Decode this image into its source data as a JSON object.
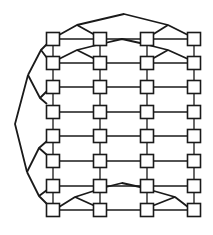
{
  "diagram": {
    "type": "grid-graph-with-tree-connectors",
    "stroke_color": "#1a1a1a",
    "node_fill": "#ffffff",
    "node_size": 13,
    "columns_x": [
      53,
      100,
      147,
      194
    ],
    "rows_y": [
      39,
      63,
      87,
      112,
      136,
      161,
      186,
      210
    ],
    "grid": {
      "rows": 8,
      "cols": 4
    },
    "extra_edges": [
      {
        "name": "top-arc-1",
        "points": [
          [
            59,
            35
          ],
          [
            77,
            25
          ],
          [
            124,
            14
          ],
          [
            168,
            25
          ],
          [
            188,
            35
          ]
        ]
      },
      {
        "name": "top-arc-1-branch-left",
        "points": [
          [
            77,
            25
          ],
          [
            95,
            35
          ]
        ]
      },
      {
        "name": "top-arc-1-branch-right",
        "points": [
          [
            168,
            25
          ],
          [
            152,
            35
          ]
        ]
      },
      {
        "name": "top-arc-2",
        "points": [
          [
            59,
            59
          ],
          [
            77,
            50
          ],
          [
            105,
            43
          ],
          [
            122,
            39
          ],
          [
            140,
            43
          ],
          [
            168,
            50
          ],
          [
            188,
            59
          ]
        ]
      },
      {
        "name": "top-arc-2-branch-left",
        "points": [
          [
            77,
            50
          ],
          [
            95,
            59
          ]
        ]
      },
      {
        "name": "top-arc-2-branch-right",
        "points": [
          [
            168,
            50
          ],
          [
            152,
            59
          ]
        ]
      },
      {
        "name": "bottom-arc",
        "points": [
          [
            59,
            207
          ],
          [
            75,
            197
          ],
          [
            106,
            187
          ],
          [
            122,
            183
          ],
          [
            140,
            187
          ],
          [
            175,
            197
          ],
          [
            188,
            207
          ]
        ]
      },
      {
        "name": "bottom-arc-branch-left",
        "points": [
          [
            75,
            197
          ],
          [
            95,
            206
          ]
        ]
      },
      {
        "name": "bottom-arc-branch-right",
        "points": [
          [
            175,
            197
          ],
          [
            152,
            206
          ]
        ]
      },
      {
        "name": "left-tree-a",
        "points": [
          [
            47,
            44
          ],
          [
            41,
            50
          ],
          [
            47,
            58
          ]
        ]
      },
      {
        "name": "left-tree-a-stem",
        "points": [
          [
            41,
            50
          ],
          [
            28,
            75
          ]
        ]
      },
      {
        "name": "left-tree-b",
        "points": [
          [
            47,
            91
          ],
          [
            40,
            98
          ],
          [
            47,
            104
          ]
        ]
      },
      {
        "name": "left-tree-b-stem",
        "points": [
          [
            40,
            98
          ],
          [
            28,
            75
          ]
        ]
      },
      {
        "name": "left-tree-root",
        "points": [
          [
            28,
            75
          ],
          [
            15,
            124
          ],
          [
            27,
            172
          ]
        ]
      },
      {
        "name": "left-tree-c",
        "points": [
          [
            47,
            141
          ],
          [
            39,
            148
          ],
          [
            47,
            155
          ]
        ]
      },
      {
        "name": "left-tree-c-stem",
        "points": [
          [
            39,
            148
          ],
          [
            27,
            172
          ]
        ]
      },
      {
        "name": "left-tree-d",
        "points": [
          [
            47,
            190
          ],
          [
            39,
            196
          ],
          [
            47,
            204
          ]
        ]
      },
      {
        "name": "left-tree-d-stem",
        "points": [
          [
            39,
            196
          ],
          [
            27,
            172
          ]
        ]
      }
    ]
  }
}
